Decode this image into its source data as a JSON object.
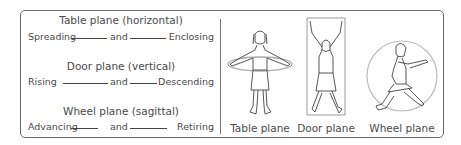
{
  "planes": [
    {
      "title": "Table plane (horizontal)",
      "left": "Spreading",
      "mid": "and",
      "right": "Enclosing"
    },
    {
      "title": "Door plane (vertical)",
      "left": "Rising",
      "mid": "and",
      "right": "Descending"
    },
    {
      "title": "Wheel plane (sagittal)",
      "left": "Advancing",
      "mid": "and",
      "right": "Retiring"
    }
  ],
  "figures": [
    {
      "caption": "Table plane",
      "icon": "figure-arms-spread-horizontal-ring"
    },
    {
      "caption": "Door plane",
      "icon": "figure-arms-raised-vertical-rectangle"
    },
    {
      "caption": "Wheel plane",
      "icon": "figure-lunging-sagittal-circle"
    }
  ],
  "colors": {
    "border": "#666666",
    "text": "#4a4a4a",
    "plane_outline": "#bbbbbb"
  }
}
